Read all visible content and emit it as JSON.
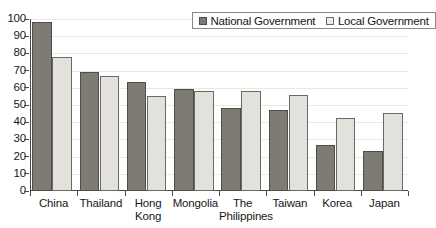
{
  "chart_data": {
    "type": "bar",
    "title": "",
    "subtitle": "",
    "xlabel": "",
    "ylabel": "",
    "ylim": [
      0,
      100
    ],
    "ytick_step": 10,
    "yticks": [
      "100",
      "90",
      "80",
      "70",
      "60",
      "50",
      "40",
      "30",
      "20",
      "10",
      "0"
    ],
    "grid": true,
    "grid_axis": "y",
    "legend_position": "top-right",
    "categories": [
      "China",
      "Thailand",
      "Hong Kong",
      "Mongolia",
      "The Philippines",
      "Taiwan",
      "Korea",
      "Japan"
    ],
    "series": [
      {
        "name": "National Government",
        "color": "#7d7b74",
        "values": [
          98,
          69,
          63.5,
          59.5,
          48,
          47,
          26.5,
          23
        ]
      },
      {
        "name": "Local Government",
        "color": "#e2e1db",
        "values": [
          78,
          67,
          55,
          58,
          58,
          56,
          42.5,
          45.5
        ]
      }
    ]
  },
  "legend": {
    "items": [
      {
        "label": "National Government",
        "swatch": "national"
      },
      {
        "label": "Local Government",
        "swatch": "local"
      }
    ]
  },
  "colors": {
    "national": "#7d7b74",
    "local": "#e2e1db",
    "axis": "#4a4a4a",
    "grid": "#e9e9e4",
    "text": "#171717",
    "background": "#ffffff"
  }
}
